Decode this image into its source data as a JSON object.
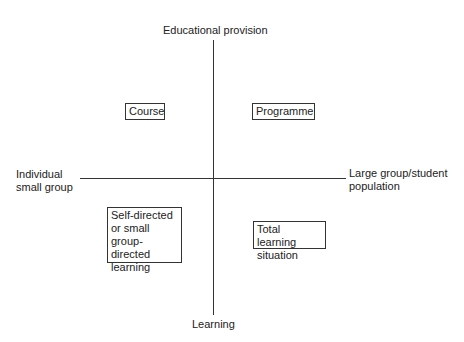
{
  "axes": {
    "top": "Educational provision",
    "bottom": "Learning",
    "left": [
      "Individual",
      "small group"
    ],
    "right": [
      "Large group/student",
      "population"
    ]
  },
  "quadrants": {
    "top_left": "Course",
    "top_right": "Programme",
    "bottom_left": [
      "Self-directed",
      "or small",
      "group-directed",
      "learning"
    ],
    "bottom_right": [
      "Total learning",
      "situation"
    ]
  }
}
